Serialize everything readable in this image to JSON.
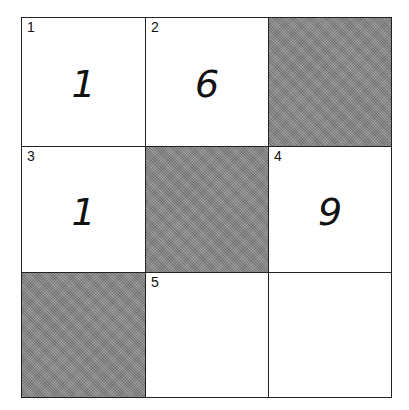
{
  "puzzle": {
    "rows": 3,
    "cols": 3,
    "shade_color": "#8c8c8c",
    "cells": [
      {
        "row": 0,
        "col": 0,
        "shaded": false,
        "number": "1",
        "value": "1"
      },
      {
        "row": 0,
        "col": 1,
        "shaded": false,
        "number": "2",
        "value": "6"
      },
      {
        "row": 0,
        "col": 2,
        "shaded": true,
        "number": "",
        "value": ""
      },
      {
        "row": 1,
        "col": 0,
        "shaded": false,
        "number": "3",
        "value": "1"
      },
      {
        "row": 1,
        "col": 1,
        "shaded": true,
        "number": "",
        "value": ""
      },
      {
        "row": 1,
        "col": 2,
        "shaded": false,
        "number": "4",
        "value": "9"
      },
      {
        "row": 2,
        "col": 0,
        "shaded": true,
        "number": "",
        "value": ""
      },
      {
        "row": 2,
        "col": 1,
        "shaded": false,
        "number": "5",
        "value": ""
      },
      {
        "row": 2,
        "col": 2,
        "shaded": false,
        "number": "",
        "value": ""
      }
    ]
  }
}
